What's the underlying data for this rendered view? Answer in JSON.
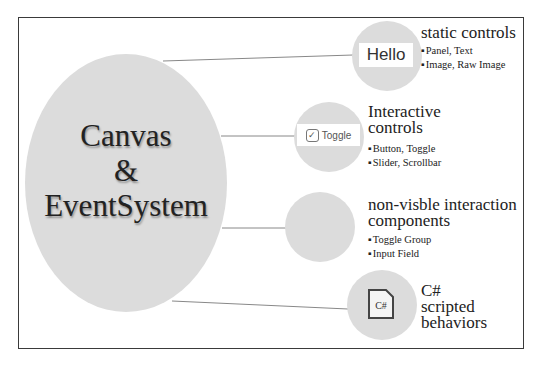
{
  "central": {
    "line1": "Canvas",
    "line2": "&",
    "line3": "EventSystem"
  },
  "nodes": [
    {
      "icon_text": "Hello",
      "title": "static controls",
      "bullets": [
        "Panel, Text",
        "Image, Raw Image"
      ]
    },
    {
      "icon_text": "Toggle",
      "check": "✓",
      "title_line1": "Interactive",
      "title_line2": "controls",
      "bullets": [
        "Button, Toggle",
        "Slider, Scrollbar"
      ]
    },
    {
      "title_line1": "non-visble interaction",
      "title_line2": "components",
      "bullets": [
        "Toggle Group",
        "Input Field"
      ]
    },
    {
      "icon_text": "C#",
      "title_line1": "C#",
      "title_line2": "scripted",
      "title_line3": "behaviors"
    }
  ],
  "colors": {
    "circle": "#dcdcdc",
    "frame": "#3a3a3a"
  }
}
